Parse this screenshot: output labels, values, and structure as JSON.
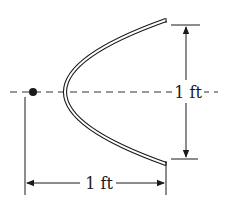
{
  "figure": {
    "colors": {
      "ink": "#1a1a1a",
      "reflector_fill": "#ffffff",
      "background": "#ffffff"
    },
    "reflector": {
      "vertex": [
        22,
        92
      ],
      "top_end": [
        166,
        22
      ],
      "bottom_end": [
        166,
        162
      ],
      "thickness_px": 4
    },
    "focus_point": {
      "cx": 33,
      "cy": 92,
      "r": 4
    },
    "axis": {
      "y": 92,
      "x_start": 10,
      "x_end": 218,
      "style": "dashed"
    },
    "dimensions": {
      "height": {
        "label": "1 ft",
        "direction": "vertical",
        "x": 186,
        "y_top": 25,
        "y_bottom": 159
      },
      "depth": {
        "label": "1 ft",
        "direction": "horizontal",
        "y": 183,
        "x_left": 25,
        "x_right": 166
      }
    }
  }
}
